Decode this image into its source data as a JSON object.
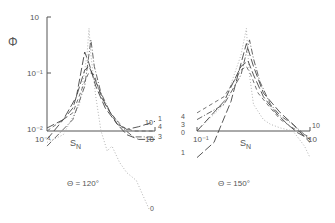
{
  "chart_data": [
    {
      "type": "line",
      "title": "Θ = 120°",
      "ylabel": "Φ",
      "xlabel": "S_N",
      "xscale": "log",
      "yscale": "log",
      "xlim": [
        0.1,
        10
      ],
      "ylim": [
        0.01,
        10
      ],
      "xticks": [
        "10⁻¹",
        "10"
      ],
      "yticks": [
        "10⁻²",
        "10⁻¹",
        "10"
      ],
      "series": [
        {
          "name": "0",
          "style": "dotted",
          "x": [
            0.1,
            0.2,
            0.4,
            0.55,
            0.6,
            0.65,
            0.8,
            1.0,
            1.3,
            1.6,
            2.2,
            3,
            4.5,
            6,
            8
          ],
          "y": [
            0.005,
            0.008,
            0.05,
            1.0,
            5.0,
            1.0,
            0.08,
            0.01,
            0.003,
            0.004,
            0.0015,
            0.0008,
            0.0005,
            0.0002,
            8e-05
          ]
        },
        {
          "name": "1",
          "style": "long-dash",
          "x": [
            0.1,
            0.2,
            0.35,
            0.5,
            0.6,
            0.8,
            1.2,
            2,
            3,
            5,
            8,
            10
          ],
          "y": [
            0.012,
            0.02,
            0.08,
            1.2,
            0.6,
            0.15,
            0.04,
            0.015,
            0.011,
            0.013,
            0.016,
            0.018
          ]
        },
        {
          "name": "3",
          "style": "dash-dot",
          "x": [
            0.1,
            0.3,
            0.5,
            0.65,
            0.75,
            1.0,
            1.5,
            2.5,
            4,
            7,
            10
          ],
          "y": [
            0.004,
            0.02,
            0.15,
            2.5,
            0.5,
            0.1,
            0.03,
            0.012,
            0.007,
            0.007,
            0.007
          ]
        },
        {
          "name": "4",
          "style": "dashed",
          "x": [
            0.1,
            0.3,
            0.5,
            0.6,
            0.75,
            1.0,
            1.5,
            2.5,
            4,
            7,
            10
          ],
          "y": [
            0.01,
            0.03,
            0.2,
            0.35,
            0.3,
            0.08,
            0.03,
            0.013,
            0.01,
            0.01,
            0.01
          ]
        },
        {
          "name": "10",
          "style": "long-dash",
          "x": [
            0.1,
            0.3,
            0.5,
            0.6,
            0.8,
            1.2,
            2,
            3,
            5,
            8,
            10
          ],
          "y": [
            0.006,
            0.04,
            0.4,
            0.5,
            0.2,
            0.05,
            0.015,
            0.008,
            0.006,
            0.006,
            0.006
          ]
        }
      ]
    },
    {
      "type": "line",
      "title": "Θ = 150°",
      "ylabel": "Φ",
      "xlabel": "S_N",
      "xscale": "log",
      "yscale": "log",
      "xlim": [
        0.1,
        10
      ],
      "ylim": [
        0.01,
        10
      ],
      "xticks": [
        "10⁻¹",
        "10"
      ],
      "yticks": [],
      "series": [
        {
          "name": "0",
          "style": "dotted",
          "x": [
            0.1,
            0.3,
            0.6,
            0.75,
            0.8,
            0.85,
            1.0,
            1.5,
            2,
            3,
            5,
            8,
            10
          ],
          "y": [
            0.01,
            0.05,
            1.0,
            5.0,
            1.0,
            0.3,
            0.05,
            0.02,
            0.015,
            0.012,
            0.01,
            0.004,
            0.002
          ]
        },
        {
          "name": "1",
          "style": "long-dash",
          "x": [
            0.1,
            0.2,
            0.4,
            0.6,
            0.75,
            1.0,
            1.5,
            3,
            5,
            8,
            10
          ],
          "y": [
            0.002,
            0.005,
            0.06,
            0.6,
            2.0,
            0.5,
            0.1,
            0.03,
            0.015,
            0.007,
            0.005
          ]
        },
        {
          "name": "3",
          "style": "dash-dot",
          "x": [
            0.1,
            0.3,
            0.6,
            0.85,
            1.0,
            1.3,
            2,
            3,
            5,
            8,
            10
          ],
          "y": [
            0.02,
            0.05,
            0.3,
            2.5,
            0.8,
            0.2,
            0.05,
            0.025,
            0.015,
            0.008,
            0.006
          ]
        },
        {
          "name": "4",
          "style": "dashed",
          "x": [
            0.1,
            0.3,
            0.6,
            0.75,
            0.9,
            1.2,
            2,
            3,
            5,
            8,
            10
          ],
          "y": [
            0.03,
            0.08,
            0.4,
            0.5,
            0.3,
            0.1,
            0.04,
            0.02,
            0.012,
            0.008,
            0.007
          ]
        },
        {
          "name": "10",
          "style": "long-dash",
          "x": [
            0.1,
            0.3,
            0.6,
            0.8,
            1.0,
            1.5,
            2.5,
            4,
            6,
            10
          ],
          "y": [
            0.01,
            0.06,
            0.5,
            0.7,
            0.3,
            0.08,
            0.03,
            0.015,
            0.009,
            0.006
          ]
        }
      ]
    }
  ]
}
